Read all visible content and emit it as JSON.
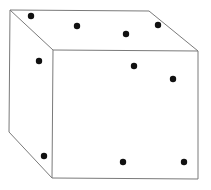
{
  "diagram": {
    "type": "cube-with-dots",
    "colors": {
      "background": "#ffffff",
      "edge": "#7a7a7a",
      "dot": "#111111"
    },
    "vertices": {
      "back_top_left": [
        10,
        10
      ],
      "back_top_right": [
        149,
        11
      ],
      "back_bottom_left": [
        9,
        132
      ],
      "front_top_left": [
        53,
        50
      ],
      "front_top_right": [
        198,
        51
      ],
      "front_bottom_left": [
        52,
        178
      ],
      "front_bottom_right": [
        198,
        179
      ]
    },
    "dots": [
      {
        "face": "top",
        "x": 31,
        "y": 16
      },
      {
        "face": "top",
        "x": 77,
        "y": 26
      },
      {
        "face": "top",
        "x": 126,
        "y": 34
      },
      {
        "face": "top",
        "x": 158,
        "y": 25
      },
      {
        "face": "left",
        "x": 39,
        "y": 61
      },
      {
        "face": "left",
        "x": 44,
        "y": 156
      },
      {
        "face": "front",
        "x": 134,
        "y": 66
      },
      {
        "face": "front",
        "x": 173,
        "y": 79
      },
      {
        "face": "front",
        "x": 123,
        "y": 162
      },
      {
        "face": "front",
        "x": 184,
        "y": 162
      }
    ],
    "dot_radius": 3.2
  }
}
